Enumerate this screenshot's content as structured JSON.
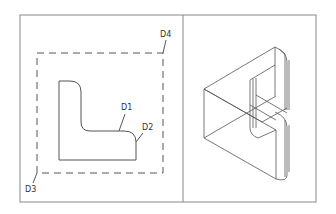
{
  "figure": {
    "type": "cad-drawing",
    "panels": [
      {
        "name": "2d-profile-view"
      },
      {
        "name": "3d-isometric-view"
      }
    ],
    "labels": {
      "d1": "D1",
      "d2": "D2",
      "d3": "D3",
      "d4": "D4"
    },
    "colors": {
      "line": "#555555",
      "frame": "#777777",
      "background": "#ffffff"
    }
  }
}
